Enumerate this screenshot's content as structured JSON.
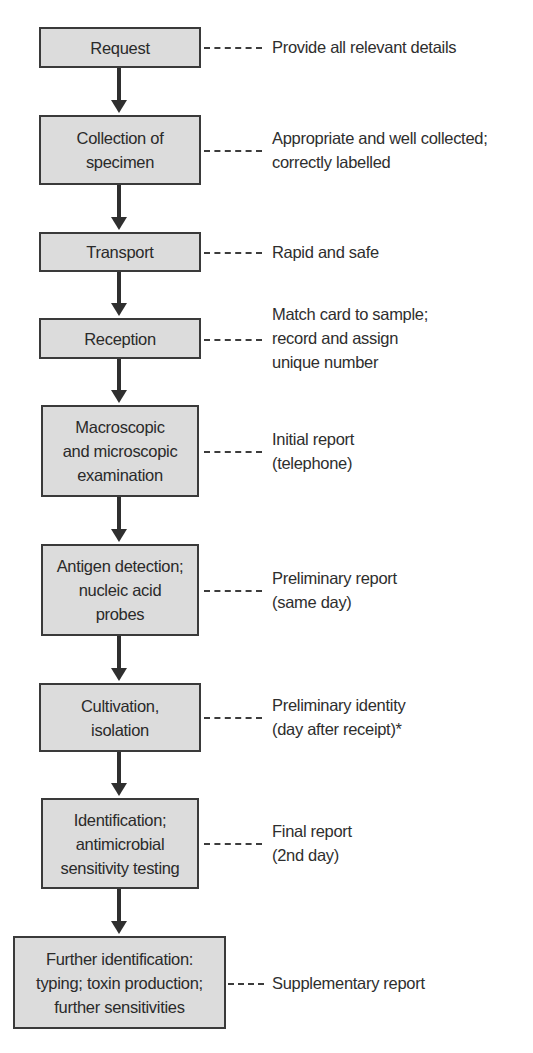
{
  "diagram": {
    "type": "flowchart",
    "colors": {
      "box_fill": "#dcdcdc",
      "box_border": "#3a3a3a",
      "arrow": "#2f2f2f",
      "text": "#2e2e2e"
    },
    "steps": [
      {
        "label": "Request",
        "note": "Provide all relevant details"
      },
      {
        "label": "Collection of\nspecimen",
        "note": "Appropriate and well collected;\ncorrectly labelled"
      },
      {
        "label": "Transport",
        "note": "Rapid and safe"
      },
      {
        "label": "Reception",
        "note": "Match card to sample;\nrecord and assign\nunique number"
      },
      {
        "label": "Macroscopic\nand microscopic\nexamination",
        "note": "Initial report\n(telephone)"
      },
      {
        "label": "Antigen detection;\nnucleic acid\nprobes",
        "note": "Preliminary report\n(same day)"
      },
      {
        "label": "Cultivation,\nisolation",
        "note": "Preliminary identity\n(day after receipt)*"
      },
      {
        "label": "Identification;\nantimicrobial\nsensitivity testing",
        "note": "Final report\n(2nd day)"
      },
      {
        "label": "Further identification:\ntyping; toxin production;\nfurther sensitivities",
        "note": "Supplementary report"
      }
    ]
  }
}
